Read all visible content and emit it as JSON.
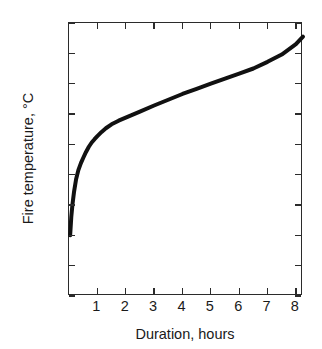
{
  "chart_data": {
    "type": "line",
    "title": "",
    "xlabel": "Duration, hours",
    "ylabel": "Fire temperature, °C",
    "xlim": [
      0,
      8.25
    ],
    "ylim": [
      400,
      1300
    ],
    "grid": false,
    "legend": null,
    "xticks": [
      1,
      2,
      3,
      4,
      5,
      6,
      7,
      8
    ],
    "xticklabels": [
      "1",
      "2",
      "3",
      "4",
      "5",
      "6",
      "7",
      "8"
    ],
    "yticks": [
      400,
      500,
      600,
      700,
      800,
      900,
      1000,
      1100,
      1200,
      1300
    ],
    "yticklabels": [
      "400",
      "500",
      "600",
      "700",
      "800",
      "900",
      "1000",
      "1100",
      "1200",
      "1300"
    ],
    "line_color": "#111111",
    "line_width_px": 4,
    "series": [
      {
        "name": "standard fire curve",
        "x": [
          0.04,
          0.08,
          0.12,
          0.18,
          0.25,
          0.33,
          0.42,
          0.5,
          0.6,
          0.7,
          0.8,
          0.9,
          1.0,
          1.15,
          1.3,
          1.5,
          1.75,
          2.0,
          2.5,
          3.0,
          3.5,
          4.0,
          4.5,
          5.0,
          5.5,
          6.0,
          6.5,
          7.0,
          7.5,
          8.0,
          8.25
        ],
        "y": [
          600,
          660,
          700,
          745,
          785,
          815,
          838,
          855,
          875,
          892,
          906,
          917,
          927,
          941,
          953,
          966,
          978,
          988,
          1008,
          1028,
          1047,
          1066,
          1083,
          1100,
          1117,
          1133,
          1150,
          1172,
          1196,
          1230,
          1255
        ]
      }
    ]
  }
}
